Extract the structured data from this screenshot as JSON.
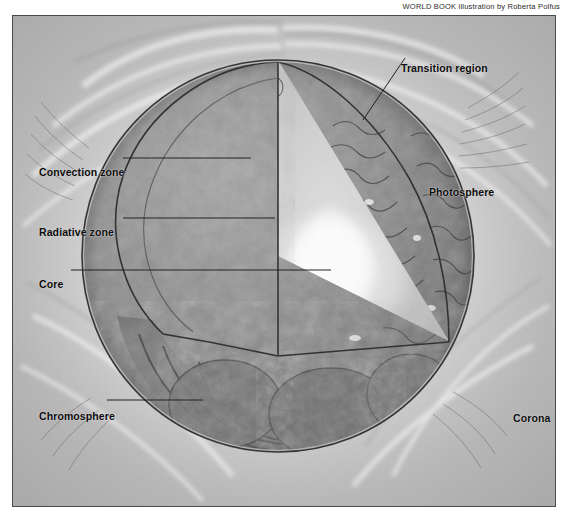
{
  "credit": {
    "text": "WORLD BOOK illustration by Roberta Polfus"
  },
  "figure": {
    "labels": {
      "convection_zone": "Convection zone",
      "radiative_zone": "Radiative zone",
      "core": "Core",
      "chromosphere": "Chromosphere",
      "transition_region": "Transition region",
      "photosphere": "Photosphere",
      "corona": "Corona"
    }
  },
  "colors": {
    "frame_border": "#4a4a4a",
    "background": "#b9b9b9",
    "label_text": "#0d0d0d",
    "leader_line": "#1f1f1f",
    "core_highlight": "#ffffff",
    "radiative_zone": "#dcdcdc",
    "convection_zone": "#8d8d8d",
    "photosphere": "#777777",
    "chromosphere": "#6f6f6f",
    "corona": "#cfcfcf"
  }
}
